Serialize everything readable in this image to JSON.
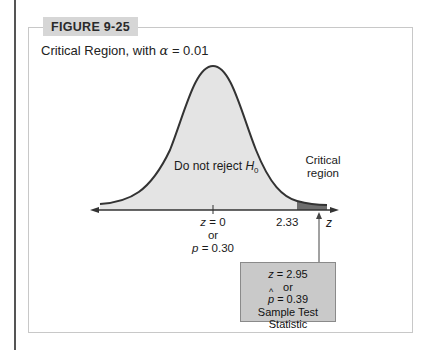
{
  "figure": {
    "tag": "FIGURE 9-25",
    "caption_prefix": "Critical Region, with ",
    "caption_symbol": "α",
    "caption_suffix": " = 0.01"
  },
  "diagram": {
    "curve": "standard normal distribution",
    "fill_color_main": "#e4e4e4",
    "fill_color_critical": "#6e6e6e",
    "curve_color": "#333333",
    "labels": {
      "do_not_reject_text": "Do not reject ",
      "do_not_reject_symbol": "H",
      "do_not_reject_sub": "0",
      "critical_line1": "Critical",
      "critical_line2": "region",
      "axis_var": "z",
      "center_z_var": "z",
      "center_z_val": " = 0",
      "center_or": "or",
      "center_p_var": "p",
      "center_p_val": " = 0.30",
      "critical_value": "2.33"
    },
    "stat_box": {
      "z_var": "z",
      "z_val": " = 2.95",
      "or": "or",
      "p_var": "p",
      "p_hat": "^",
      "p_val": " = 0.39",
      "caption": "Sample Test Statistic"
    }
  }
}
